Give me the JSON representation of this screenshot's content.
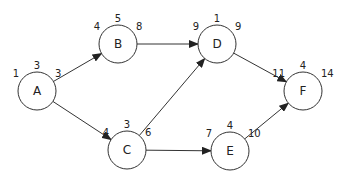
{
  "diagram": {
    "type": "activity-network",
    "stroke_color": "#333333",
    "nodes": [
      {
        "id": "A",
        "label": "A",
        "cx": 37,
        "cy": 91,
        "r": 19,
        "es": "1",
        "dur": "3",
        "ef": "3"
      },
      {
        "id": "B",
        "label": "B",
        "cx": 118,
        "cy": 44,
        "r": 19,
        "es": "4",
        "dur": "5",
        "ef": "8"
      },
      {
        "id": "C",
        "label": "C",
        "cx": 127,
        "cy": 150,
        "r": 19,
        "es": "4",
        "dur": "3",
        "ef": "6"
      },
      {
        "id": "D",
        "label": "D",
        "cx": 217,
        "cy": 44,
        "r": 19,
        "es": "9",
        "dur": "1",
        "ef": "9"
      },
      {
        "id": "E",
        "label": "E",
        "cx": 230,
        "cy": 151,
        "r": 19,
        "es": "7",
        "dur": "4",
        "ef": "10"
      },
      {
        "id": "F",
        "label": "F",
        "cx": 303,
        "cy": 91,
        "r": 19,
        "es": "11",
        "dur": "4",
        "ef": "14"
      }
    ],
    "edges": [
      {
        "from": "A",
        "to": "B"
      },
      {
        "from": "A",
        "to": "C"
      },
      {
        "from": "B",
        "to": "D"
      },
      {
        "from": "C",
        "to": "D"
      },
      {
        "from": "C",
        "to": "E"
      },
      {
        "from": "D",
        "to": "F"
      },
      {
        "from": "E",
        "to": "F"
      }
    ]
  }
}
